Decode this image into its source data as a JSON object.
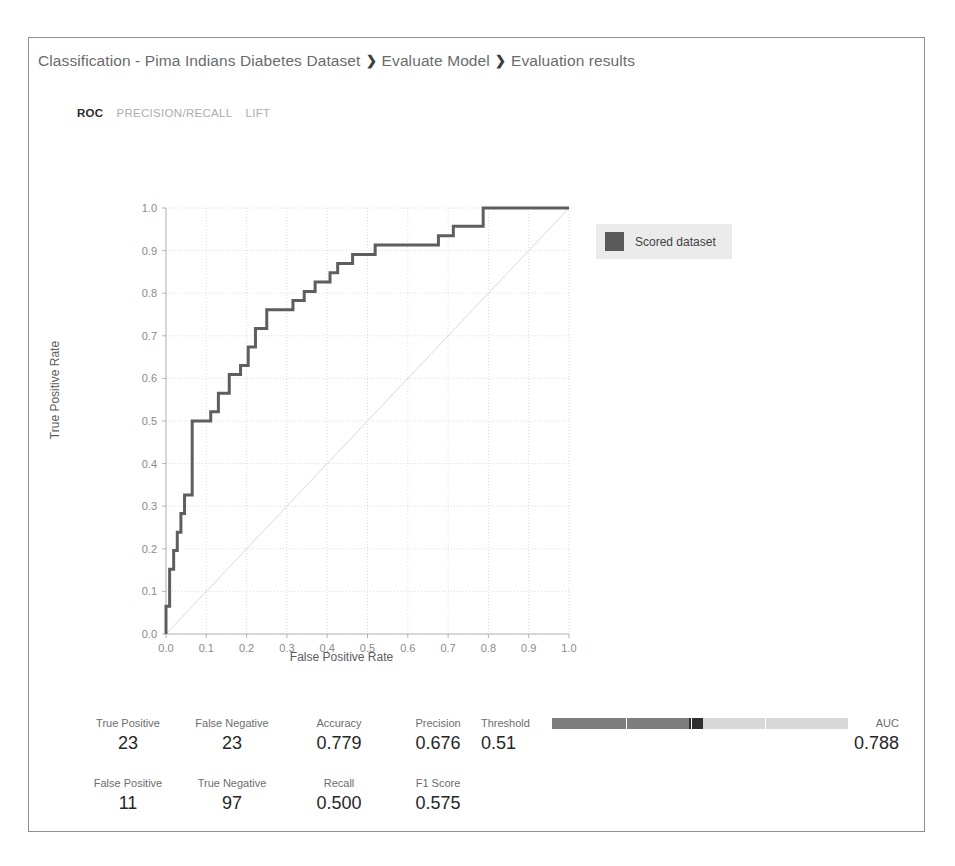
{
  "breadcrumb": {
    "items": [
      "Classification - Pima Indians Diabetes Dataset",
      "Evaluate Model",
      "Evaluation results"
    ],
    "separator": "❯"
  },
  "tabs": [
    {
      "label": "ROC",
      "active": true
    },
    {
      "label": "PRECISION/RECALL",
      "active": false
    },
    {
      "label": "LIFT",
      "active": false
    }
  ],
  "legend": {
    "label": "Scored dataset",
    "swatch_color": "#595959",
    "background": "#ebebeb"
  },
  "metrics": {
    "true_positive": {
      "label": "True Positive",
      "value": "23"
    },
    "false_negative": {
      "label": "False Negative",
      "value": "23"
    },
    "false_positive": {
      "label": "False Positive",
      "value": "11"
    },
    "true_negative": {
      "label": "True Negative",
      "value": "97"
    },
    "accuracy": {
      "label": "Accuracy",
      "value": "0.779"
    },
    "recall": {
      "label": "Recall",
      "value": "0.500"
    },
    "precision": {
      "label": "Precision",
      "value": "0.676"
    },
    "f1_score": {
      "label": "F1 Score",
      "value": "0.575"
    },
    "threshold": {
      "label": "Threshold",
      "value": "0.51",
      "fraction": 0.51
    },
    "auc": {
      "label": "AUC",
      "value": "0.788"
    }
  },
  "chart_data": {
    "type": "line",
    "title": "",
    "xlabel": "False Positive Rate",
    "ylabel": "True Positive Rate",
    "xlim": [
      0.0,
      1.0
    ],
    "ylim": [
      0.0,
      1.0
    ],
    "xticks": [
      "0.0",
      "0.1",
      "0.2",
      "0.3",
      "0.4",
      "0.5",
      "0.6",
      "0.7",
      "0.8",
      "0.9",
      "1.0"
    ],
    "yticks": [
      "0.0",
      "0.1",
      "0.2",
      "0.3",
      "0.4",
      "0.5",
      "0.6",
      "0.7",
      "0.8",
      "0.9",
      "1.0"
    ],
    "grid": true,
    "legend_position": "right",
    "series": [
      {
        "name": "Scored dataset",
        "color": "#5e5e5e",
        "step": true,
        "x": [
          0.0,
          0.0,
          0.009,
          0.009,
          0.019,
          0.019,
          0.028,
          0.028,
          0.037,
          0.037,
          0.046,
          0.046,
          0.065,
          0.065,
          0.111,
          0.111,
          0.13,
          0.13,
          0.157,
          0.157,
          0.185,
          0.185,
          0.204,
          0.204,
          0.222,
          0.222,
          0.25,
          0.25,
          0.315,
          0.315,
          0.343,
          0.343,
          0.37,
          0.37,
          0.407,
          0.407,
          0.426,
          0.426,
          0.463,
          0.463,
          0.519,
          0.519,
          0.676,
          0.676,
          0.713,
          0.713,
          0.787,
          0.787,
          0.898,
          1.0
        ],
        "y": [
          0.0,
          0.065,
          0.065,
          0.152,
          0.152,
          0.196,
          0.196,
          0.239,
          0.239,
          0.283,
          0.283,
          0.326,
          0.326,
          0.5,
          0.5,
          0.522,
          0.522,
          0.565,
          0.565,
          0.609,
          0.609,
          0.63,
          0.63,
          0.674,
          0.674,
          0.717,
          0.717,
          0.761,
          0.761,
          0.783,
          0.783,
          0.804,
          0.804,
          0.826,
          0.826,
          0.848,
          0.848,
          0.87,
          0.87,
          0.891,
          0.891,
          0.913,
          0.913,
          0.935,
          0.935,
          0.957,
          0.957,
          1.0,
          1.0,
          1.0
        ]
      },
      {
        "name": "Random baseline",
        "color": "#d9d9d9",
        "step": false,
        "x": [
          0.0,
          1.0
        ],
        "y": [
          0.0,
          1.0
        ]
      }
    ]
  }
}
